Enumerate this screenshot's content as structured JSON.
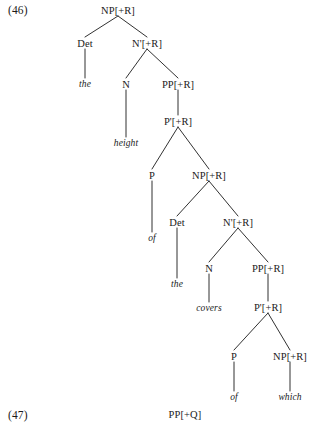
{
  "figure": {
    "example_label_46": "(46)",
    "example_label_47": "(47)",
    "next_tree_root": "PP[+Q]"
  },
  "tree": {
    "nodes": [
      {
        "id": "np1",
        "label": "NP[+R]",
        "x": 118,
        "y": 10,
        "type": "category"
      },
      {
        "id": "det1",
        "label": "Det",
        "x": 85,
        "y": 43,
        "type": "category"
      },
      {
        "id": "nbar1",
        "label": "N'[+R]",
        "x": 147,
        "y": 43,
        "type": "category"
      },
      {
        "id": "the1",
        "label": "the",
        "x": 85,
        "y": 84,
        "type": "terminal"
      },
      {
        "id": "n1",
        "label": "N",
        "x": 126,
        "y": 84,
        "type": "category"
      },
      {
        "id": "pp1",
        "label": "PP[+R]",
        "x": 178,
        "y": 84,
        "type": "category"
      },
      {
        "id": "height",
        "label": "height",
        "x": 126,
        "y": 143,
        "type": "terminal"
      },
      {
        "id": "pbar1",
        "label": "P'[+R]",
        "x": 178,
        "y": 121,
        "type": "category"
      },
      {
        "id": "p1",
        "label": "P",
        "x": 152,
        "y": 175,
        "type": "category"
      },
      {
        "id": "np2",
        "label": "NP[+R]",
        "x": 209,
        "y": 175,
        "type": "category"
      },
      {
        "id": "of1",
        "label": "of",
        "x": 152,
        "y": 238,
        "type": "terminal"
      },
      {
        "id": "det2",
        "label": "Det",
        "x": 177,
        "y": 222,
        "type": "category"
      },
      {
        "id": "nbar2",
        "label": "N'[+R]",
        "x": 238,
        "y": 222,
        "type": "category"
      },
      {
        "id": "the2",
        "label": "the",
        "x": 177,
        "y": 284,
        "type": "terminal"
      },
      {
        "id": "n2",
        "label": "N",
        "x": 209,
        "y": 268,
        "type": "category"
      },
      {
        "id": "pp2",
        "label": "PP[+R]",
        "x": 268,
        "y": 268,
        "type": "category"
      },
      {
        "id": "covers",
        "label": "covers",
        "x": 209,
        "y": 308,
        "type": "terminal"
      },
      {
        "id": "pbar2",
        "label": "P'[+R]",
        "x": 268,
        "y": 307,
        "type": "category"
      },
      {
        "id": "p2",
        "label": "P",
        "x": 234,
        "y": 356,
        "type": "category"
      },
      {
        "id": "np3",
        "label": "NP[+R]",
        "x": 290,
        "y": 356,
        "type": "category"
      },
      {
        "id": "of2",
        "label": "of",
        "x": 234,
        "y": 397,
        "type": "terminal"
      },
      {
        "id": "which",
        "label": "which",
        "x": 290,
        "y": 397,
        "type": "terminal"
      }
    ],
    "edges": [
      {
        "from": "np1",
        "to": "det1"
      },
      {
        "from": "np1",
        "to": "nbar1"
      },
      {
        "from": "det1",
        "to": "the1"
      },
      {
        "from": "nbar1",
        "to": "n1"
      },
      {
        "from": "nbar1",
        "to": "pp1"
      },
      {
        "from": "n1",
        "to": "height"
      },
      {
        "from": "pp1",
        "to": "pbar1"
      },
      {
        "from": "pbar1",
        "to": "p1"
      },
      {
        "from": "pbar1",
        "to": "np2"
      },
      {
        "from": "p1",
        "to": "of1"
      },
      {
        "from": "np2",
        "to": "det2"
      },
      {
        "from": "np2",
        "to": "nbar2"
      },
      {
        "from": "det2",
        "to": "the2"
      },
      {
        "from": "nbar2",
        "to": "n2"
      },
      {
        "from": "nbar2",
        "to": "pp2"
      },
      {
        "from": "n2",
        "to": "covers"
      },
      {
        "from": "pp2",
        "to": "pbar2"
      },
      {
        "from": "pbar2",
        "to": "p2"
      },
      {
        "from": "pbar2",
        "to": "np3"
      },
      {
        "from": "p2",
        "to": "of2"
      },
      {
        "from": "np3",
        "to": "which"
      }
    ]
  },
  "labels": {
    "ex46": {
      "text": "(46)",
      "x": 8,
      "y": 10
    },
    "ex47": {
      "text": "(47)",
      "x": 8,
      "y": 415
    },
    "pp_q": {
      "text": "PP[+Q]",
      "x": 185,
      "y": 414
    }
  },
  "colors": {
    "ink": "#1a1a1a",
    "background": "#ffffff"
  }
}
